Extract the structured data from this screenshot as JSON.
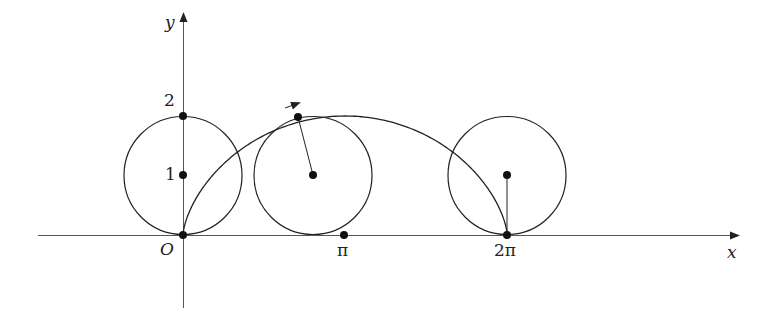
{
  "diagram": {
    "axes": {
      "x_label": "x",
      "y_label": "y",
      "origin_label": "O"
    },
    "x_ticks": [
      "π",
      "2π"
    ],
    "y_ticks": [
      "1",
      "2"
    ],
    "circle_radius": 1,
    "circles_at_t": [
      0,
      2.4,
      6.2832
    ],
    "colors": {
      "stroke": "#222222",
      "axis": "#555555"
    }
  }
}
